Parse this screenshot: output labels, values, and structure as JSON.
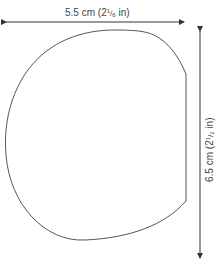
{
  "diagram": {
    "type": "template-outline",
    "width_label": {
      "value": "5.5 cm",
      "imperial_prefix": "(2",
      "fraction_num": "1",
      "fraction_den": "6",
      "imperial_suffix": " in)"
    },
    "height_label": {
      "value": "6.5 cm",
      "imperial_prefix": "(2",
      "fraction_num": "1",
      "fraction_den": "2",
      "imperial_suffix": " in)"
    },
    "colors": {
      "outline": "#555555",
      "arrow": "#333333",
      "text": "#444444",
      "background": "#ffffff"
    }
  }
}
